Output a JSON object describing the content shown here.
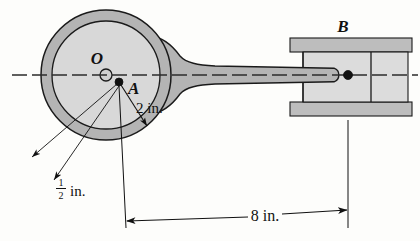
{
  "figure": {
    "type": "mechanism-diagram",
    "background_color": "#fdfdfb",
    "outline_color": "#1a1a1a",
    "annulus_color": "#b4b4b4",
    "inner_disk_color": "#d8d8d8",
    "rod_color": "#b4b4b4",
    "rail_color": "#bdbdbd",
    "block_color": "#dcdcdc",
    "pin_color": "#111111"
  },
  "labels": {
    "center_point": "O",
    "crank_point": "A",
    "slider_point": "B"
  },
  "dimensions": {
    "radius": {
      "value": "2 in.",
      "number": 2,
      "unit": "in.",
      "description": "distance from A to inner disk edge"
    },
    "thickness": {
      "numerator": "1",
      "denominator": "2",
      "unit": "in.",
      "value": "1/2 in.",
      "number": 0.5,
      "description": "annulus ring thickness"
    },
    "span": {
      "value": "8 in.",
      "number": 8,
      "unit": "in.",
      "description": "horizontal distance from A to pin at B"
    }
  },
  "geometry": {
    "centerline_y": 75,
    "disk": {
      "cx": 106,
      "cy": 75,
      "outer_r": 65,
      "inner_r": 54,
      "hub_r": 6
    },
    "point_a": {
      "x": 119,
      "y": 82,
      "r": 4
    },
    "pin_b": {
      "x": 348,
      "y": 75,
      "r": 4.5
    },
    "dimension_line_y": 220,
    "dimension_x_start": 126,
    "dimension_x_end": 348
  }
}
